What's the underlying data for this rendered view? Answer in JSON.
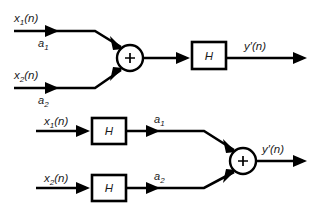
{
  "figure": {
    "background_color": "#ffffff",
    "stroke_color": "#000000",
    "text_color": "#1a1a1a"
  },
  "diagrams": [
    {
      "id": "scaling-then-filtering",
      "inputs": [
        {
          "signal_label": "x",
          "signal_sub": "1",
          "signal_tail": "(n)",
          "gain_label": "a",
          "gain_sub": "1"
        },
        {
          "signal_label": "x",
          "signal_sub": "2",
          "signal_tail": "(n)",
          "gain_label": "a",
          "gain_sub": "2"
        }
      ],
      "adder": {
        "symbol": "+"
      },
      "block": {
        "label": "H"
      },
      "output": {
        "label": "y′(n)"
      }
    },
    {
      "id": "filtering-then-scaling",
      "inputs": [
        {
          "signal_label": "x",
          "signal_sub": "1",
          "signal_tail": "(n)",
          "block_label": "H",
          "gain_label": "a",
          "gain_sub": "1"
        },
        {
          "signal_label": "x",
          "signal_sub": "2",
          "signal_tail": "(n)",
          "block_label": "H",
          "gain_label": "a",
          "gain_sub": "2"
        }
      ],
      "adder": {
        "symbol": "+"
      },
      "output": {
        "label": "y′(n)"
      }
    }
  ]
}
